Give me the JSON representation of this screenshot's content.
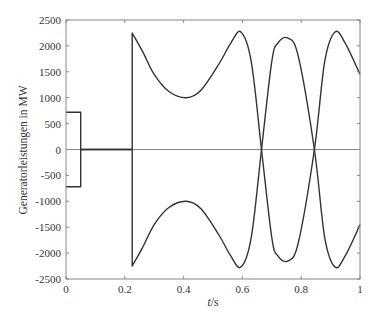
{
  "chart_data": {
    "type": "line",
    "title": "",
    "xlabel": "t/s",
    "xlabel_italic": "t",
    "xlabel_unit": "/s",
    "ylabel": "Generatorleistungen in MW",
    "xlim": [
      0,
      1
    ],
    "ylim": [
      -2500,
      2500
    ],
    "xticks": [
      0,
      0.2,
      0.4,
      0.6,
      0.8,
      1
    ],
    "xtick_labels": [
      "0",
      "0.2",
      "0.4",
      "0.6",
      "0.8",
      "1"
    ],
    "yticks": [
      2500,
      2000,
      1500,
      1000,
      500,
      0,
      -500,
      -1000,
      -1500,
      -2000,
      -2500
    ],
    "ytick_labels": [
      "2500",
      "2000",
      "1500",
      "1000",
      "500",
      "0",
      "-500",
      "-1000",
      "-1500",
      "-2000",
      "-2500"
    ],
    "grid": false,
    "legend": null,
    "zero_line": true,
    "series": [
      {
        "name": "Generator 1",
        "color": "#333333",
        "points": [
          [
            0,
            720
          ],
          [
            0.05,
            720
          ],
          [
            0.05,
            0
          ],
          [
            0.225,
            0
          ],
          [
            0.225,
            2250
          ],
          [
            0.26,
            1900
          ],
          [
            0.3,
            1450
          ],
          [
            0.35,
            1120
          ],
          [
            0.41,
            1000
          ],
          [
            0.46,
            1150
          ],
          [
            0.52,
            1650
          ],
          [
            0.56,
            2050
          ],
          [
            0.595,
            2270
          ],
          [
            0.63,
            1700
          ],
          [
            0.665,
            0
          ],
          [
            0.7,
            -1700
          ],
          [
            0.72,
            -2050
          ],
          [
            0.755,
            -2150
          ],
          [
            0.79,
            -1800
          ],
          [
            0.845,
            0
          ],
          [
            0.88,
            1700
          ],
          [
            0.915,
            2270
          ],
          [
            0.95,
            2050
          ],
          [
            1.0,
            1450
          ]
        ]
      },
      {
        "name": "Generator 2",
        "color": "#333333",
        "points": [
          [
            0,
            -720
          ],
          [
            0.05,
            -720
          ],
          [
            0.05,
            0
          ],
          [
            0.225,
            0
          ],
          [
            0.225,
            -2250
          ],
          [
            0.26,
            -1900
          ],
          [
            0.3,
            -1450
          ],
          [
            0.35,
            -1120
          ],
          [
            0.41,
            -1000
          ],
          [
            0.46,
            -1150
          ],
          [
            0.52,
            -1650
          ],
          [
            0.56,
            -2050
          ],
          [
            0.595,
            -2270
          ],
          [
            0.63,
            -1700
          ],
          [
            0.665,
            0
          ],
          [
            0.7,
            1700
          ],
          [
            0.72,
            2050
          ],
          [
            0.755,
            2150
          ],
          [
            0.79,
            1800
          ],
          [
            0.845,
            0
          ],
          [
            0.88,
            -1700
          ],
          [
            0.915,
            -2270
          ],
          [
            0.95,
            -2050
          ],
          [
            1.0,
            -1450
          ]
        ]
      }
    ]
  },
  "colors": {
    "axis": "#888888",
    "line": "#333333",
    "zero_line": "#888888",
    "text": "#333333"
  }
}
